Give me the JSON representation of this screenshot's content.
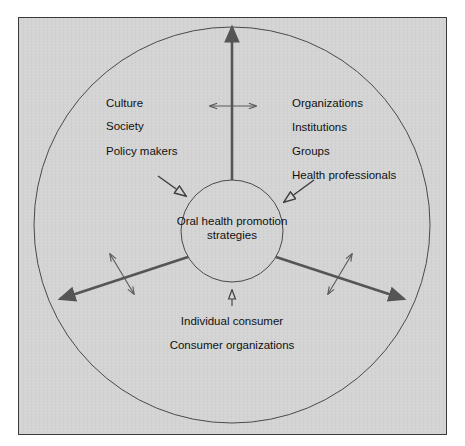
{
  "figure": {
    "top_cropped_text": "",
    "panel": {
      "background_color": "#d4d4d4",
      "border_color": "#3a3a3a"
    }
  },
  "center": {
    "name": "oral-health-promotion-strategies",
    "line1": "Oral health promotion",
    "line2": "strategies"
  },
  "sectors": [
    {
      "id": "upper-left",
      "name": "societal-context-sector",
      "items": [
        "Culture",
        "Society",
        "Policy makers"
      ]
    },
    {
      "id": "upper-right",
      "name": "organizational-sector",
      "items": [
        "Organizations",
        "Institutions",
        "Groups",
        "Health professionals"
      ]
    },
    {
      "id": "bottom",
      "name": "consumer-sector",
      "items": [
        "Individual consumer",
        "Consumer organizations"
      ]
    }
  ],
  "labels": {
    "culture": "Culture",
    "society": "Society",
    "policy_makers": "Policy makers",
    "organizations": "Organizations",
    "institutions": "Institutions",
    "groups": "Groups",
    "health_professionals": "Health professionals",
    "individual_consumer": "Individual consumer",
    "consumer_organizations": "Consumer organizations"
  },
  "geometry": {
    "outer_circle": {
      "cx": 232,
      "cy": 225,
      "r": 198
    },
    "inner_circle": {
      "cx": 232,
      "cy": 231,
      "r": 51
    },
    "divider_angles_deg": [
      90,
      210,
      330
    ],
    "divider_color": "#555555",
    "circle_stroke_color": "#4a4a4a"
  },
  "arrows": {
    "cross_divider_top": "double-headed-horizontal-arrow",
    "cross_divider_lower_left": "double-headed-perpendicular-arrow",
    "cross_divider_lower_right": "double-headed-perpendicular-arrow",
    "inward_upper_left": "arrow-pointing-to-center",
    "inward_upper_right": "arrow-pointing-to-center",
    "inward_bottom": "arrow-pointing-to-center"
  }
}
